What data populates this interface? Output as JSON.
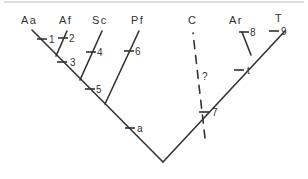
{
  "diagram": {
    "type": "cladogram",
    "colors": {
      "line": "#333333",
      "border": "#bdbdbd",
      "background": "#ffffff"
    },
    "taxa": [
      {
        "id": "Aa",
        "label": "Aa"
      },
      {
        "id": "Af",
        "label": "Af"
      },
      {
        "id": "Sc",
        "label": "Sc"
      },
      {
        "id": "Pf",
        "label": "Pf"
      },
      {
        "id": "C",
        "label": "C"
      },
      {
        "id": "Ar",
        "label": "Ar"
      },
      {
        "id": "T",
        "label": "T"
      }
    ],
    "characters": {
      "c1": "1",
      "c2": "2",
      "c3": "3",
      "c4": "4",
      "c5": "5",
      "c6": "6",
      "ca": "a",
      "c7": "7",
      "ct": "t",
      "c8": "8",
      "c9": "9"
    },
    "uncertain_label": "?"
  }
}
